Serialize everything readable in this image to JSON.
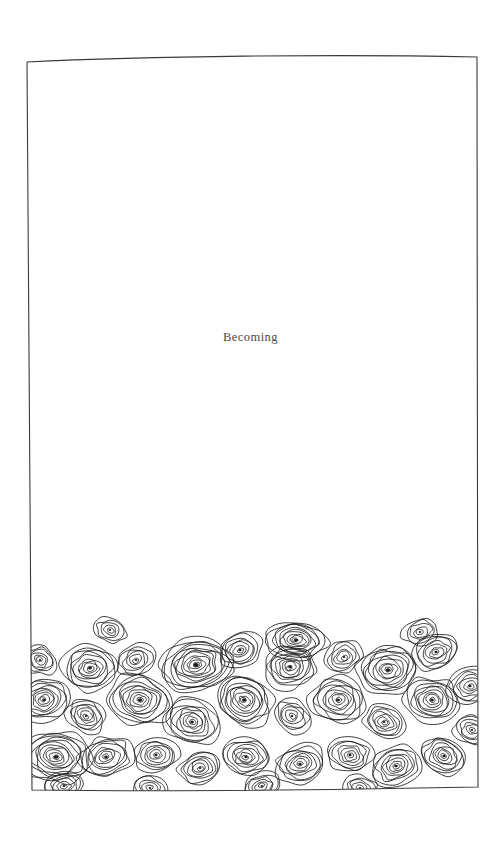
{
  "page": {
    "background_color": "#ffffff",
    "width": 501,
    "height": 845
  },
  "border": {
    "name": "hand-drawn-rectangle-frame",
    "stroke_color": "#3a3a3a",
    "stroke_width": 1.1,
    "corners": {
      "top_left": [
        27,
        62
      ],
      "top_right": [
        477,
        57
      ],
      "bottom_right": [
        478,
        787
      ],
      "bottom_left": [
        32,
        790
      ]
    }
  },
  "title": {
    "text": "Becoming",
    "color": "#4a4a4a",
    "center_x": 258,
    "baseline_y": 343,
    "font_size": 12.5
  },
  "texture": {
    "name": "concentric-rings-field",
    "description": "Dense field of irregular hand-drawn concentric oval rings, like tree rings or pebbles, filling the lower portion of the framed page",
    "stroke_color": "#1e1e1e",
    "stroke_width": 0.85,
    "ring_spacing": 3.1,
    "top_edge_min_y": 624,
    "bottom_edge_y": 787,
    "left_edge_x": 31,
    "right_edge_x": 477,
    "cells": [
      {
        "cx": 44,
        "cy": 700,
        "rx": 26,
        "ry": 21,
        "rot": -14,
        "rings": 9
      },
      {
        "cx": 56,
        "cy": 757,
        "rx": 34,
        "ry": 25,
        "rot": 8,
        "rings": 11
      },
      {
        "cx": 40,
        "cy": 660,
        "rx": 17,
        "ry": 14,
        "rot": 22,
        "rings": 6
      },
      {
        "cx": 90,
        "cy": 668,
        "rx": 28,
        "ry": 22,
        "rot": -6,
        "rings": 9
      },
      {
        "cx": 86,
        "cy": 716,
        "rx": 20,
        "ry": 16,
        "rot": 30,
        "rings": 7
      },
      {
        "cx": 106,
        "cy": 757,
        "rx": 26,
        "ry": 20,
        "rot": -18,
        "rings": 8
      },
      {
        "cx": 140,
        "cy": 700,
        "rx": 31,
        "ry": 25,
        "rot": 12,
        "rings": 10
      },
      {
        "cx": 136,
        "cy": 660,
        "rx": 19,
        "ry": 15,
        "rot": -25,
        "rings": 6
      },
      {
        "cx": 156,
        "cy": 755,
        "rx": 22,
        "ry": 17,
        "rot": 5,
        "rings": 7
      },
      {
        "cx": 196,
        "cy": 665,
        "rx": 37,
        "ry": 27,
        "rot": -8,
        "rings": 12
      },
      {
        "cx": 192,
        "cy": 722,
        "rx": 27,
        "ry": 22,
        "rot": 18,
        "rings": 9
      },
      {
        "cx": 200,
        "cy": 768,
        "rx": 21,
        "ry": 16,
        "rot": -12,
        "rings": 7
      },
      {
        "cx": 244,
        "cy": 700,
        "rx": 30,
        "ry": 24,
        "rot": 26,
        "rings": 10
      },
      {
        "cx": 240,
        "cy": 650,
        "rx": 22,
        "ry": 17,
        "rot": -20,
        "rings": 7
      },
      {
        "cx": 246,
        "cy": 757,
        "rx": 24,
        "ry": 18,
        "rot": 10,
        "rings": 8
      },
      {
        "cx": 290,
        "cy": 667,
        "rx": 26,
        "ry": 21,
        "rot": -15,
        "rings": 9
      },
      {
        "cx": 296,
        "cy": 640,
        "rx": 30,
        "ry": 19,
        "rot": 6,
        "rings": 10
      },
      {
        "cx": 292,
        "cy": 716,
        "rx": 20,
        "ry": 16,
        "rot": 28,
        "rings": 6
      },
      {
        "cx": 300,
        "cy": 764,
        "rx": 25,
        "ry": 19,
        "rot": -10,
        "rings": 8
      },
      {
        "cx": 338,
        "cy": 700,
        "rx": 28,
        "ry": 23,
        "rot": 14,
        "rings": 9
      },
      {
        "cx": 344,
        "cy": 657,
        "rx": 19,
        "ry": 15,
        "rot": -22,
        "rings": 6
      },
      {
        "cx": 350,
        "cy": 755,
        "rx": 22,
        "ry": 17,
        "rot": 8,
        "rings": 7
      },
      {
        "cx": 388,
        "cy": 670,
        "rx": 30,
        "ry": 24,
        "rot": -5,
        "rings": 10
      },
      {
        "cx": 384,
        "cy": 722,
        "rx": 21,
        "ry": 16,
        "rot": 20,
        "rings": 7
      },
      {
        "cx": 396,
        "cy": 766,
        "rx": 26,
        "ry": 19,
        "rot": -16,
        "rings": 8
      },
      {
        "cx": 432,
        "cy": 700,
        "rx": 27,
        "ry": 22,
        "rot": 10,
        "rings": 9
      },
      {
        "cx": 436,
        "cy": 652,
        "rx": 23,
        "ry": 18,
        "rot": -18,
        "rings": 7
      },
      {
        "cx": 444,
        "cy": 756,
        "rx": 24,
        "ry": 18,
        "rot": 24,
        "rings": 8
      },
      {
        "cx": 470,
        "cy": 686,
        "rx": 22,
        "ry": 18,
        "rot": -8,
        "rings": 7
      },
      {
        "cx": 472,
        "cy": 730,
        "rx": 18,
        "ry": 14,
        "rot": 16,
        "rings": 6
      },
      {
        "cx": 64,
        "cy": 786,
        "rx": 20,
        "ry": 14,
        "rot": -6,
        "rings": 6
      },
      {
        "cx": 150,
        "cy": 788,
        "rx": 18,
        "ry": 13,
        "rot": 12,
        "rings": 5
      },
      {
        "cx": 262,
        "cy": 786,
        "rx": 19,
        "ry": 13,
        "rot": -14,
        "rings": 6
      },
      {
        "cx": 360,
        "cy": 788,
        "rx": 17,
        "ry": 12,
        "rot": 9,
        "rings": 5
      },
      {
        "cx": 110,
        "cy": 630,
        "rx": 16,
        "ry": 12,
        "rot": 18,
        "rings": 5
      },
      {
        "cx": 420,
        "cy": 632,
        "rx": 18,
        "ry": 13,
        "rot": -12,
        "rings": 5
      }
    ]
  }
}
